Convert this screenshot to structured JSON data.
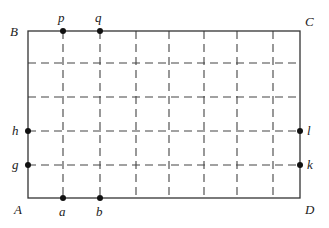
{
  "diagram": {
    "type": "rectangular grid",
    "rectangle": {
      "corners": {
        "A": "bottom-left",
        "B": "top-left",
        "C": "top-right",
        "D": "bottom-right"
      },
      "columns": 7,
      "rows": 5
    },
    "labels": {
      "A": "A",
      "B": "B",
      "C": "C",
      "D": "D",
      "p": "p",
      "q": "q",
      "a": "a",
      "b": "b",
      "h": "h",
      "g": "g",
      "l": "l",
      "k": "k"
    },
    "points": [
      {
        "name": "p",
        "edge": "top",
        "grid_index": 1
      },
      {
        "name": "q",
        "edge": "top",
        "grid_index": 2
      },
      {
        "name": "a",
        "edge": "bottom",
        "grid_index": 1
      },
      {
        "name": "b",
        "edge": "bottom",
        "grid_index": 2
      },
      {
        "name": "h",
        "edge": "left",
        "grid_index": 2,
        "from": "bottom"
      },
      {
        "name": "g",
        "edge": "left",
        "grid_index": 1,
        "from": "bottom"
      },
      {
        "name": "l",
        "edge": "right",
        "grid_index": 2,
        "from": "bottom"
      },
      {
        "name": "k",
        "edge": "right",
        "grid_index": 1,
        "from": "bottom"
      }
    ],
    "line_style": {
      "border": "solid",
      "grid": "dashed"
    }
  }
}
